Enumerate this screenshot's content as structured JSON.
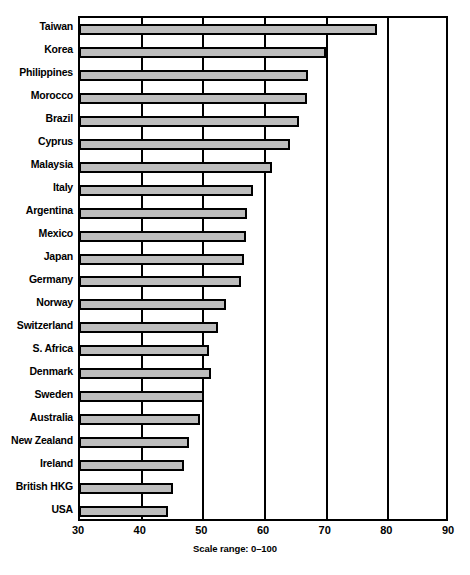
{
  "chart_data": {
    "type": "bar",
    "orientation": "horizontal",
    "title": "",
    "subtitle": "",
    "xlabel": "",
    "ylabel": "",
    "caption": "Scale range: 0–100",
    "xlim": [
      30,
      90
    ],
    "xticks": [
      30,
      40,
      50,
      60,
      70,
      80,
      90
    ],
    "grid": true,
    "legend": null,
    "categories": [
      "Taiwan",
      "Korea",
      "Philippines",
      "Morocco",
      "Brazil",
      "Cyprus",
      "Malaysia",
      "Italy",
      "Argentina",
      "Mexico",
      "Japan",
      "Germany",
      "Norway",
      "Switzerland",
      "S. Africa",
      "Denmark",
      "Sweden",
      "Australia",
      "New Zealand",
      "Ireland",
      "British HKG",
      "USA"
    ],
    "values": [
      78.3,
      70.0,
      67.2,
      66.9,
      65.7,
      64.2,
      61.3,
      58.2,
      57.2,
      57.0,
      56.8,
      56.3,
      53.8,
      52.6,
      51.1,
      51.4,
      50.2,
      49.6,
      47.9,
      47.0,
      45.2,
      44.4
    ]
  },
  "style": {
    "bar_fill": "#bdbdbd",
    "bar_stroke": "#000000",
    "frame_color": "#000000",
    "background": "#ffffff"
  }
}
